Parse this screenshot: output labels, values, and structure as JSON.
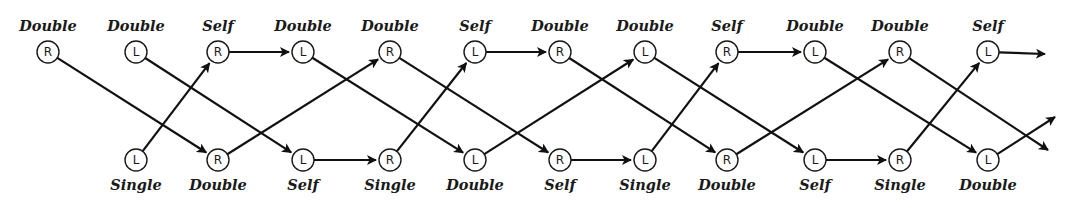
{
  "diagram": {
    "type": "state-sequence",
    "colors": {
      "stroke": "#111111",
      "text": "#1a1a1a",
      "background": "#ffffff"
    },
    "node_radius": 11,
    "top_row": {
      "y": 52,
      "label_y": 31,
      "nodes": [
        {
          "id": "t0",
          "x": 48,
          "letter": "R",
          "label": "Double"
        },
        {
          "id": "t1",
          "x": 136,
          "letter": "L",
          "label": "Double"
        },
        {
          "id": "t2",
          "x": 218,
          "letter": "R",
          "label": "Self"
        },
        {
          "id": "t3",
          "x": 303,
          "letter": "L",
          "label": "Double"
        },
        {
          "id": "t4",
          "x": 390,
          "letter": "R",
          "label": "Double"
        },
        {
          "id": "t5",
          "x": 475,
          "letter": "L",
          "label": "Self"
        },
        {
          "id": "t6",
          "x": 560,
          "letter": "R",
          "label": "Double"
        },
        {
          "id": "t7",
          "x": 645,
          "letter": "L",
          "label": "Double"
        },
        {
          "id": "t8",
          "x": 727,
          "letter": "R",
          "label": "Self"
        },
        {
          "id": "t9",
          "x": 815,
          "letter": "L",
          "label": "Double"
        },
        {
          "id": "t10",
          "x": 900,
          "letter": "R",
          "label": "Double"
        },
        {
          "id": "t11",
          "x": 988,
          "letter": "L",
          "label": "Self"
        }
      ]
    },
    "bottom_row": {
      "y": 160,
      "label_y": 190,
      "nodes": [
        {
          "id": "b1",
          "x": 136,
          "letter": "L",
          "label": "Single"
        },
        {
          "id": "b2",
          "x": 218,
          "letter": "R",
          "label": "Double"
        },
        {
          "id": "b3",
          "x": 303,
          "letter": "L",
          "label": "Self"
        },
        {
          "id": "b4",
          "x": 390,
          "letter": "R",
          "label": "Single"
        },
        {
          "id": "b5",
          "x": 475,
          "letter": "L",
          "label": "Double"
        },
        {
          "id": "b6",
          "x": 560,
          "letter": "R",
          "label": "Self"
        },
        {
          "id": "b7",
          "x": 645,
          "letter": "L",
          "label": "Single"
        },
        {
          "id": "b8",
          "x": 727,
          "letter": "R",
          "label": "Double"
        },
        {
          "id": "b9",
          "x": 815,
          "letter": "L",
          "label": "Self"
        },
        {
          "id": "b10",
          "x": 900,
          "letter": "R",
          "label": "Single"
        },
        {
          "id": "b11",
          "x": 988,
          "letter": "L",
          "label": "Double"
        }
      ]
    },
    "edges": [
      {
        "from": "t0",
        "to": "b2"
      },
      {
        "from": "t1",
        "to": "b3"
      },
      {
        "from": "b1",
        "to": "t2"
      },
      {
        "from": "t2",
        "to": "t3"
      },
      {
        "from": "b2",
        "to": "t4"
      },
      {
        "from": "t3",
        "to": "b5"
      },
      {
        "from": "b3",
        "to": "b4"
      },
      {
        "from": "b4",
        "to": "t5"
      },
      {
        "from": "t4",
        "to": "b6"
      },
      {
        "from": "t5",
        "to": "t6"
      },
      {
        "from": "b5",
        "to": "t7"
      },
      {
        "from": "t6",
        "to": "b8"
      },
      {
        "from": "b6",
        "to": "b7"
      },
      {
        "from": "b7",
        "to": "t8"
      },
      {
        "from": "t7",
        "to": "b9"
      },
      {
        "from": "t8",
        "to": "t9"
      },
      {
        "from": "b8",
        "to": "t10"
      },
      {
        "from": "t9",
        "to": "b11"
      },
      {
        "from": "b9",
        "to": "b10"
      },
      {
        "from": "b10",
        "to": "t11"
      },
      {
        "from": "t10",
        "to_point": [
          1048,
          150
        ]
      },
      {
        "from": "t11",
        "to_point": [
          1045,
          54
        ]
      },
      {
        "from": "b11",
        "to_point": [
          1055,
          117
        ]
      }
    ]
  }
}
